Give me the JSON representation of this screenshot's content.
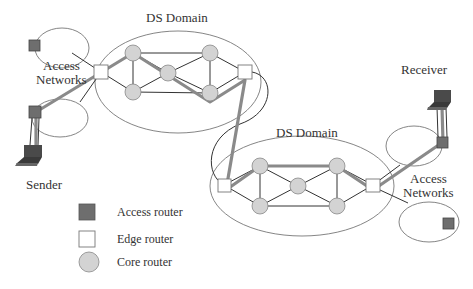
{
  "labels": {
    "ds_domain_1": "DS Domain",
    "ds_domain_2": "DS Domain",
    "access_networks_left_line1": "Access",
    "access_networks_left_line2": "Networks",
    "access_networks_right_line1": "Access",
    "access_networks_right_line2": "Networks",
    "sender": "Sender",
    "receiver": "Receiver"
  },
  "legend": {
    "items": [
      {
        "shape": "dark-square",
        "label": "Access router"
      },
      {
        "shape": "white-square",
        "label": "Edge router"
      },
      {
        "shape": "gray-circle",
        "label": "Core router"
      }
    ]
  },
  "colors": {
    "access_router": "#6e6e6e",
    "edge_router": "#ffffff",
    "core_router": "#d3d3d3",
    "path": "#8a8a8a",
    "line": "#333333",
    "ellipse": "#777777"
  }
}
